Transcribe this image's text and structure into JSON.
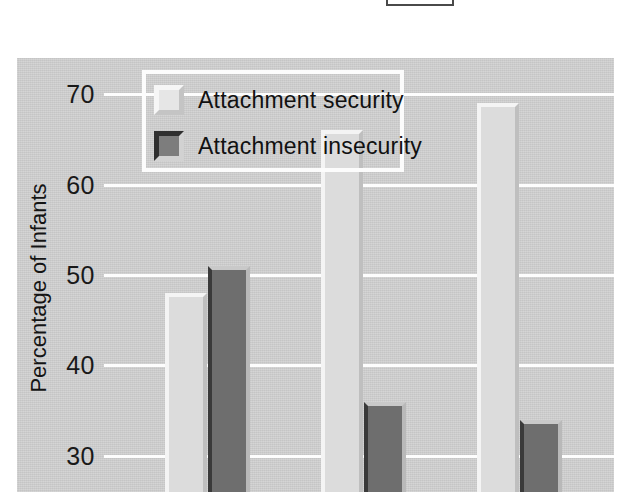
{
  "figure": {
    "background_color": "#cfcfcf",
    "page_color": "#ffffff",
    "top_crop_box": {
      "name": "partial-rectangle-outline",
      "color": "#4a4a4a"
    }
  },
  "legend": {
    "position": "top-left-inside-plot",
    "border_color": "#fcfcfc",
    "items": [
      {
        "label": "Attachment security",
        "swatch": "light",
        "color": "#e6e6e6"
      },
      {
        "label": "Attachment insecurity",
        "swatch": "dark",
        "color": "#7d7d7d"
      }
    ]
  },
  "chart_data": {
    "type": "bar",
    "title": "",
    "xlabel": "",
    "ylabel": "Percentage of Infants",
    "ylim": [
      26,
      74
    ],
    "yticks": [
      70,
      60,
      50,
      40,
      30
    ],
    "ytick_labels": [
      "70",
      "60",
      "50",
      "40",
      "30"
    ],
    "grid": true,
    "grid_color": "#fdfdfd",
    "legend_position": "upper left",
    "categories": [
      "",
      "",
      ""
    ],
    "series": [
      {
        "name": "Attachment security",
        "color": "#dcdcdc",
        "values": [
          48,
          66,
          69
        ]
      },
      {
        "name": "Attachment insecurity",
        "color": "#6e6e6e",
        "values": [
          51,
          36,
          34
        ]
      }
    ],
    "note": "x-axis category labels are cropped below the image boundary"
  }
}
